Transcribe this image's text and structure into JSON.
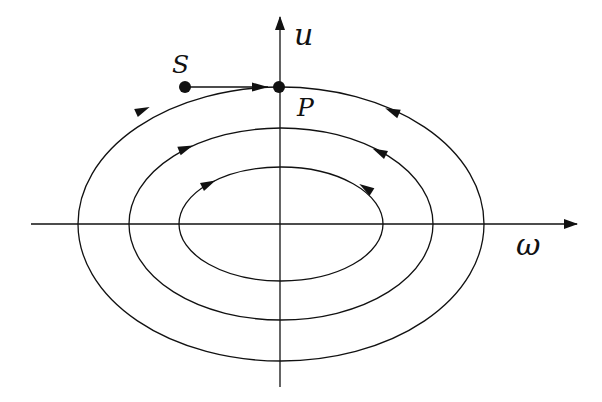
{
  "diagram": {
    "type": "phase-portrait",
    "axes": {
      "horizontal_label": "ω",
      "vertical_label": "u",
      "origin": [
        281,
        224
      ]
    },
    "points": [
      {
        "label": "S",
        "x": 185,
        "y": 87
      },
      {
        "label": "P",
        "x": 279,
        "y": 87
      }
    ],
    "orbits": [
      {
        "name": "outer",
        "cx": 281,
        "cy": 224,
        "rx": 203,
        "ry": 137,
        "direction": "clockwise"
      },
      {
        "name": "middle",
        "cx": 281,
        "cy": 224,
        "rx": 152,
        "ry": 96,
        "direction": "clockwise"
      },
      {
        "name": "inner",
        "cx": 281,
        "cy": 224,
        "rx": 102,
        "ry": 57,
        "direction": "clockwise"
      }
    ],
    "colors": {
      "stroke": "#111111",
      "background": "#ffffff"
    }
  }
}
